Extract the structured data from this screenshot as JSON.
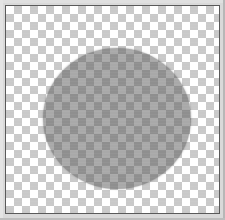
{
  "window": {
    "title": "",
    "frame_color": "#d9d9d9",
    "frame_edge_color": "#b7b7b7"
  },
  "canvas": {
    "name": "image-canvas",
    "border_color": "#5a5a5a",
    "width_px": 215,
    "height_px": 209,
    "background": {
      "type": "transparency-checkerboard",
      "light_color": "#ffffff",
      "dark_color": "#c9c9c9",
      "tile_size_px": 8
    }
  },
  "shapes": [
    {
      "name": "ellipse-shape",
      "kind": "ellipse",
      "fill_color": "#5a5a5a",
      "fill_opacity": 0.52,
      "edge": "anti-aliased",
      "bounds_px": {
        "x": 37,
        "y": 42,
        "width": 148,
        "height": 141
      },
      "center_px": {
        "x": 111,
        "y": 112
      },
      "radius_px": {
        "rx": 74,
        "ry": 70
      }
    }
  ],
  "overlays": {
    "raster_banding": "faint horizontal scanline banding"
  }
}
